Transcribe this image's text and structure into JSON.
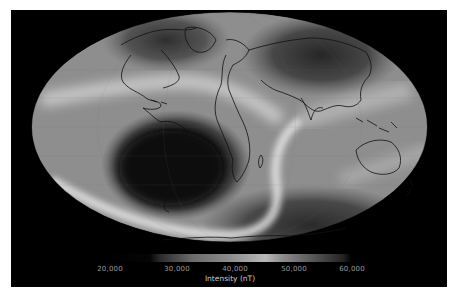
{
  "figure": {
    "title": "",
    "projection": "Mollweide",
    "background_color": "#000000",
    "coastline_color": "#111111"
  },
  "colorbar": {
    "label": "Intensity (nT)",
    "ticks": [
      "20,000",
      "30,000",
      "40,000",
      "50,000",
      "60,000"
    ],
    "tick_values": [
      20000,
      30000,
      40000,
      50000,
      60000
    ],
    "range": [
      20000,
      60000
    ],
    "colormap": "grayscale (dark→light→dark cyclic-like)"
  },
  "features": {
    "low_anomaly": "South Atlantic Anomaly (dark region over South America / South Atlantic)",
    "high_regions": [
      "Siberia / North Asia",
      "North America / Canada",
      "Antarctica / Southern Ocean"
    ],
    "bright_bands": [
      "band from Central Pacific across Atlantic to North Africa",
      "band through Southern Indian Ocean"
    ]
  }
}
